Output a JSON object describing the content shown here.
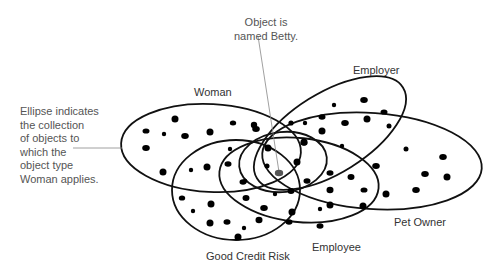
{
  "diagram": {
    "sets": [
      {
        "id": "woman",
        "label": "Woman"
      },
      {
        "id": "employer",
        "label": "Employer"
      },
      {
        "id": "pet_owner",
        "label": "Pet Owner"
      },
      {
        "id": "good_credit_risk",
        "label": "Good Credit Risk"
      },
      {
        "id": "employee",
        "label": "Employee"
      }
    ],
    "annotations": {
      "betty": {
        "lines": [
          "Object is",
          "named Betty."
        ],
        "target": "highlighted object in intersection of Woman, Employer, Pet Owner, Good Credit Risk, Employee"
      },
      "ellipse": {
        "lines": [
          "Ellipse indicates",
          "the collection",
          "of objects to",
          "which the",
          "object type",
          "Woman applies."
        ]
      }
    },
    "colors": {
      "stroke": "#111111",
      "dot": "#000000",
      "highlight_dot": "#555555",
      "leader_line": "#888888",
      "label_text": "#333333",
      "note_text": "#555555"
    }
  }
}
